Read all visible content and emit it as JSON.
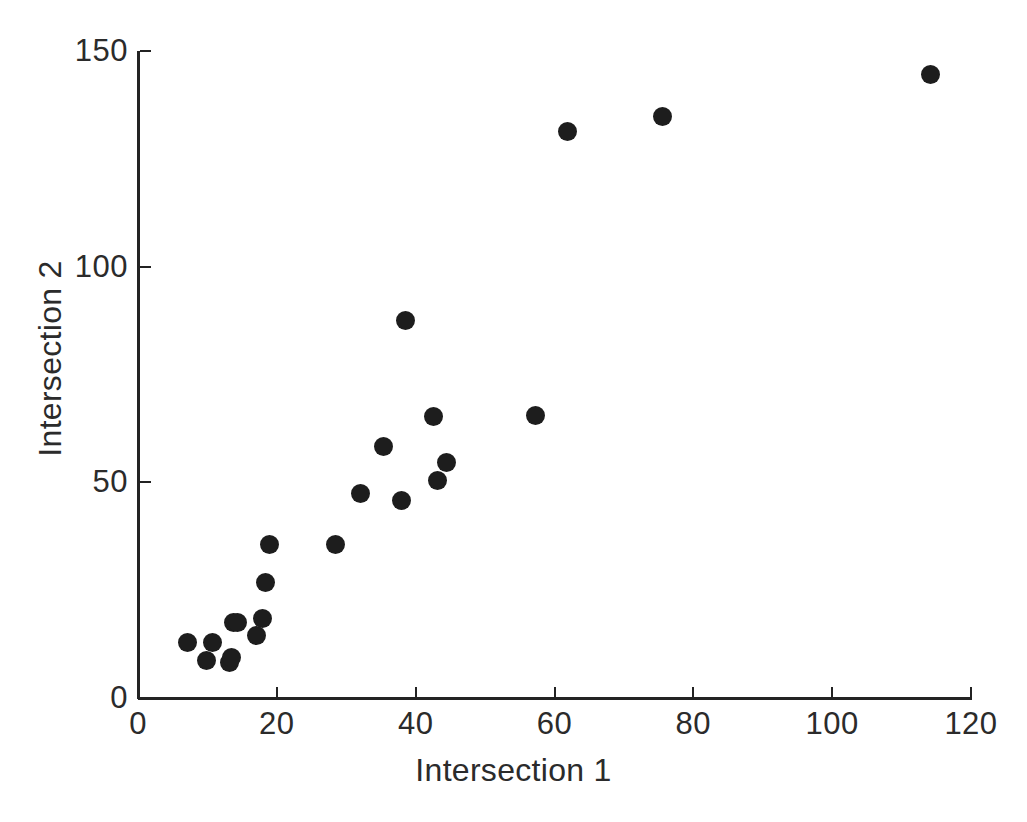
{
  "chart_data": {
    "type": "scatter",
    "title": "",
    "xlabel": "Intersection 1",
    "ylabel": "Intersection 2",
    "xlim": [
      0,
      120
    ],
    "ylim": [
      0,
      150
    ],
    "xticks": [
      0,
      20,
      40,
      60,
      80,
      100,
      120
    ],
    "yticks": [
      0,
      50,
      100,
      150
    ],
    "xtick_labels": [
      "0",
      "20",
      "40",
      "60",
      "80",
      "100",
      "120"
    ],
    "ytick_labels": [
      "0",
      "50",
      "100",
      "150"
    ],
    "grid": false,
    "legend": null,
    "marker": {
      "shape": "circle",
      "color": "#1d1d1d",
      "size_px": 19
    },
    "series": [
      {
        "name": "observations",
        "points": [
          {
            "x": 7.1,
            "y": 12.8
          },
          {
            "x": 9.9,
            "y": 8.8
          },
          {
            "x": 10.8,
            "y": 12.8
          },
          {
            "x": 13.2,
            "y": 8.3
          },
          {
            "x": 13.5,
            "y": 9.5
          },
          {
            "x": 13.7,
            "y": 17.6
          },
          {
            "x": 14.3,
            "y": 17.4
          },
          {
            "x": 17.1,
            "y": 14.4
          },
          {
            "x": 18.0,
            "y": 18.5
          },
          {
            "x": 18.3,
            "y": 26.7
          },
          {
            "x": 19.0,
            "y": 35.7
          },
          {
            "x": 28.4,
            "y": 35.7
          },
          {
            "x": 32.1,
            "y": 47.3
          },
          {
            "x": 35.3,
            "y": 58.2
          },
          {
            "x": 38.0,
            "y": 45.7
          },
          {
            "x": 38.5,
            "y": 87.6
          },
          {
            "x": 42.5,
            "y": 65.2
          },
          {
            "x": 43.1,
            "y": 50.5
          },
          {
            "x": 44.5,
            "y": 54.7
          },
          {
            "x": 57.2,
            "y": 65.6
          },
          {
            "x": 61.9,
            "y": 131.4
          },
          {
            "x": 75.6,
            "y": 134.7
          },
          {
            "x": 114.1,
            "y": 144.5
          }
        ]
      }
    ],
    "n_points": 23,
    "axis_color": "#232323",
    "background_color": "#ffffff"
  }
}
